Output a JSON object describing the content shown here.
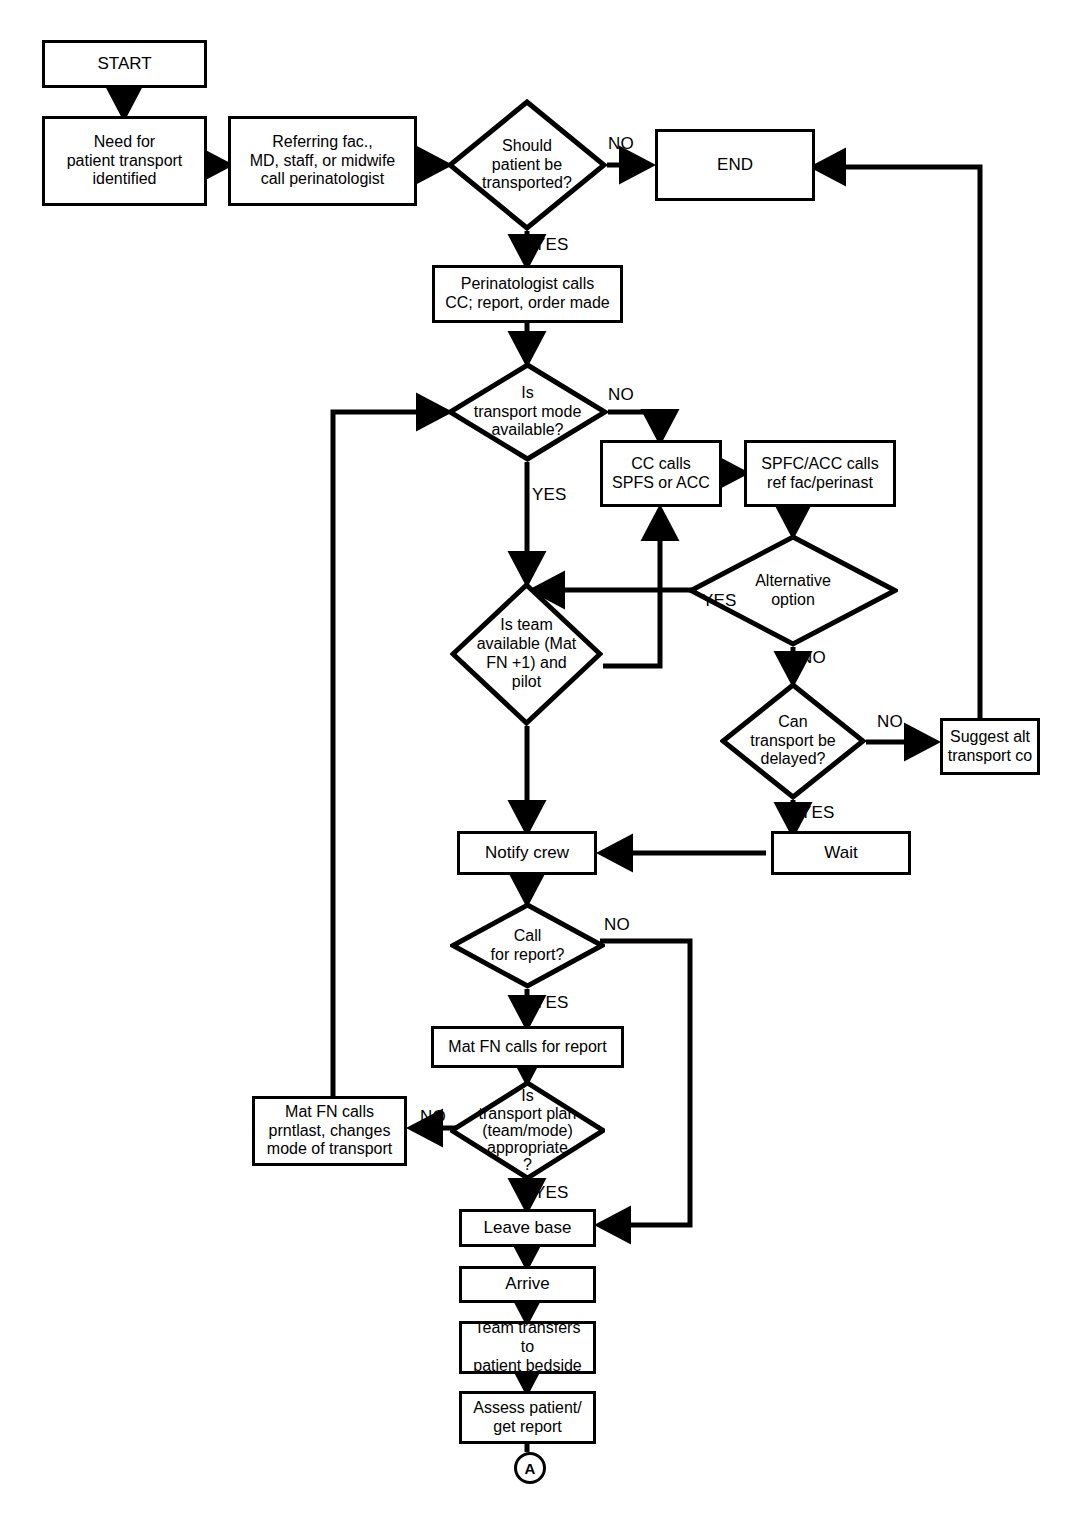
{
  "diagram": {
    "line_color": "#000000",
    "background": "#ffffff"
  },
  "nodes": {
    "start": {
      "label": "START",
      "shape": "process"
    },
    "need_transport": {
      "label": "Need for\npatient transport\nidentified",
      "shape": "process"
    },
    "referring": {
      "label": "Referring fac.,\nMD, staff, or midwife\ncall perinatologist",
      "shape": "process"
    },
    "should_transport": {
      "label": "Should\npatient be\ntransported?",
      "shape": "decision"
    },
    "end": {
      "label": "END",
      "shape": "process"
    },
    "perinatologist_calls": {
      "label": "Perinatologist calls\nCC; report, order made",
      "shape": "process"
    },
    "mode_available": {
      "label": "Is\ntransport mode\navailable?",
      "shape": "decision"
    },
    "cc_calls": {
      "label": "CC calls\nSPFS or ACC",
      "shape": "process"
    },
    "spfc_calls": {
      "label": "SPFC/ACC calls\nref fac/perinast",
      "shape": "process"
    },
    "alternative_option": {
      "label": "Alternative\noption",
      "shape": "decision"
    },
    "team_available": {
      "label": "Is team\navailable (Mat\nFN +1) and\npilot",
      "shape": "decision"
    },
    "can_delay": {
      "label": "Can\ntransport be\ndelayed?",
      "shape": "decision"
    },
    "suggest_alt": {
      "label": "Suggest alt\ntransport co",
      "shape": "process"
    },
    "notify_crew": {
      "label": "Notify crew",
      "shape": "process"
    },
    "wait": {
      "label": "Wait",
      "shape": "process"
    },
    "call_for_report": {
      "label": "Call\nfor report?",
      "shape": "decision"
    },
    "mat_fn_calls_report": {
      "label": "Mat FN calls for report",
      "shape": "process"
    },
    "plan_appropriate": {
      "label": "Is\ntransport plan\n(team/mode)\nappropriate\n?",
      "shape": "decision"
    },
    "mat_fn_prntlast": {
      "label": "Mat FN calls\nprntlast, changes\nmode of transport",
      "shape": "process"
    },
    "leave_base": {
      "label": "Leave base",
      "shape": "process"
    },
    "arrive": {
      "label": "Arrive",
      "shape": "process"
    },
    "team_transfers": {
      "label": "Team transfers to\npatient bedside",
      "shape": "process"
    },
    "assess_patient": {
      "label": "Assess patient/\nget report",
      "shape": "process"
    },
    "connector_a": {
      "label": "A",
      "shape": "connector"
    }
  },
  "edge_labels": {
    "should_transport_no": "NO",
    "should_transport_yes": "YES",
    "mode_available_no": "NO",
    "mode_available_yes": "YES",
    "alternative_yes": "YES",
    "alternative_no": "NO",
    "can_delay_no": "NO",
    "can_delay_yes": "YES",
    "call_report_no": "NO",
    "call_report_yes": "YES",
    "plan_no": "NO",
    "plan_yes": "YES"
  }
}
